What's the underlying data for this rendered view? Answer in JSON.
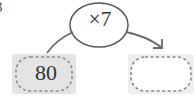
{
  "problem": {
    "number_fragment": "3"
  },
  "operation": {
    "label": "×7"
  },
  "input_box": {
    "value": "80"
  },
  "output_box": {
    "value": ""
  },
  "colors": {
    "line": "#666666",
    "box_fill_left": "#e6e6e6",
    "box_fill_right": "#f0f0f0",
    "dash": "#8a8a8a",
    "text": "#333333"
  }
}
